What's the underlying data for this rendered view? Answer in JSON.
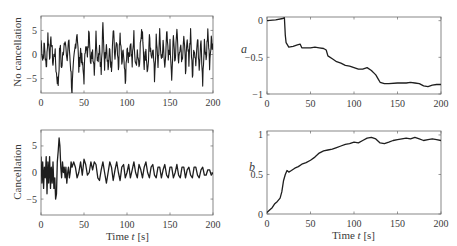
{
  "chart_data": [
    {
      "id": "no_cancellation",
      "type": "line",
      "ylabel": "No cancellation",
      "xlabel": "",
      "xlim": [
        0,
        200
      ],
      "ylim": [
        -8,
        8
      ],
      "xticks": [
        0,
        50,
        100,
        150,
        200
      ],
      "yticks": [
        -5,
        0,
        5
      ],
      "grid": false,
      "series": [
        {
          "name": "signal",
          "kind": "noise",
          "x": [
            0,
            2,
            4,
            6,
            8,
            10,
            12,
            14,
            16,
            18,
            20,
            22,
            24,
            26,
            28,
            30,
            32,
            34,
            36,
            38,
            40,
            42,
            44,
            46,
            48,
            50,
            52,
            54,
            56,
            58,
            60,
            62,
            64,
            66,
            68,
            70,
            72,
            74,
            76,
            78,
            80,
            82,
            84,
            86,
            88,
            90,
            92,
            94,
            96,
            98,
            100,
            102,
            104,
            106,
            108,
            110,
            112,
            114,
            116,
            118,
            120,
            122,
            124,
            126,
            128,
            130,
            132,
            134,
            136,
            138,
            140,
            142,
            144,
            146,
            148,
            150,
            152,
            154,
            156,
            158,
            160,
            162,
            164,
            166,
            168,
            170,
            172,
            174,
            176,
            178,
            180,
            182,
            184,
            186,
            188,
            190,
            192,
            194,
            196,
            198,
            200
          ],
          "y": [
            3,
            -1,
            2,
            -3,
            4,
            0,
            3,
            -2,
            1,
            -4,
            -6,
            2,
            -3,
            1,
            4,
            -2,
            3,
            -1,
            -7.5,
            -2,
            2,
            5,
            -3,
            1,
            -2,
            -5,
            3,
            -1,
            5.5,
            -2,
            1,
            -3,
            4,
            -1,
            2,
            -4,
            6,
            -2,
            3,
            -3,
            1,
            -4,
            5,
            -1,
            2,
            -3,
            4,
            -2,
            1,
            -6.5,
            2,
            -1,
            3,
            -2,
            4,
            -3,
            1,
            -2,
            3,
            5,
            -2,
            1,
            -4,
            3,
            -1,
            2,
            -5,
            3,
            -2,
            4,
            -1,
            2,
            -3,
            5,
            -1,
            2,
            -4,
            3,
            -1,
            6,
            -2,
            3,
            -1,
            4,
            -3,
            2,
            -1,
            5,
            -5,
            2,
            -1,
            3,
            -2,
            4,
            -6,
            2,
            -1,
            5,
            -2,
            3,
            1
          ]
        }
      ]
    },
    {
      "id": "a_param",
      "type": "line",
      "ylabel": "a",
      "xlabel": "",
      "xlim": [
        0,
        200
      ],
      "ylim": [
        -1,
        0.05
      ],
      "xticks": [
        0,
        50,
        100,
        150,
        200
      ],
      "yticks": [
        -1,
        -0.5,
        0
      ],
      "ytick_labels": [
        "−1",
        "−0.5",
        "0"
      ],
      "grid": false,
      "series": [
        {
          "name": "a",
          "x": [
            0,
            10,
            18,
            20,
            21,
            22,
            25,
            30,
            35,
            38,
            40,
            45,
            50,
            55,
            60,
            65,
            68,
            70,
            75,
            80,
            85,
            90,
            95,
            100,
            105,
            110,
            115,
            120,
            125,
            128,
            130,
            135,
            140,
            150,
            160,
            165,
            170,
            175,
            180,
            185,
            190,
            195,
            200
          ],
          "y": [
            0,
            0.01,
            0.03,
            0.04,
            -0.2,
            -0.3,
            -0.36,
            -0.35,
            -0.33,
            -0.32,
            -0.37,
            -0.37,
            -0.37,
            -0.36,
            -0.37,
            -0.38,
            -0.4,
            -0.48,
            -0.52,
            -0.56,
            -0.58,
            -0.61,
            -0.62,
            -0.64,
            -0.66,
            -0.66,
            -0.64,
            -0.68,
            -0.74,
            -0.8,
            -0.84,
            -0.86,
            -0.86,
            -0.85,
            -0.85,
            -0.84,
            -0.85,
            -0.86,
            -0.89,
            -0.9,
            -0.88,
            -0.87,
            -0.87
          ]
        }
      ]
    },
    {
      "id": "cancellation",
      "type": "line",
      "ylabel": "Cancellation",
      "xlabel": "Time t [s]",
      "xlim": [
        0,
        200
      ],
      "ylim": [
        -8,
        8
      ],
      "xticks": [
        0,
        50,
        100,
        150,
        200
      ],
      "yticks": [
        -5,
        0,
        5
      ],
      "grid": false,
      "series": [
        {
          "name": "signal",
          "x": [
            0,
            1,
            2,
            3,
            4,
            5,
            6,
            7,
            8,
            9,
            10,
            11,
            12,
            13,
            14,
            15,
            16,
            17,
            18,
            19,
            20,
            21,
            22,
            23,
            24,
            25,
            26,
            27,
            28,
            29,
            30,
            31,
            32,
            33,
            34,
            35,
            36,
            38,
            40,
            42,
            44,
            46,
            48,
            50,
            52,
            54,
            56,
            58,
            60,
            62,
            64,
            66,
            68,
            70,
            72,
            74,
            76,
            78,
            80,
            82,
            84,
            86,
            88,
            90,
            92,
            94,
            96,
            98,
            100,
            102,
            104,
            106,
            108,
            110,
            112,
            114,
            116,
            118,
            120,
            122,
            124,
            126,
            128,
            130,
            132,
            134,
            136,
            138,
            140,
            142,
            144,
            146,
            148,
            150,
            152,
            154,
            156,
            158,
            160,
            162,
            164,
            166,
            168,
            170,
            172,
            174,
            176,
            178,
            180,
            182,
            184,
            186,
            188,
            190,
            192,
            194,
            196,
            198,
            200
          ],
          "y": [
            3,
            -2,
            2,
            -3,
            1,
            -1,
            3,
            -4,
            2,
            -2,
            3,
            -3,
            1,
            -2,
            2,
            -3,
            -1,
            -5,
            -4,
            2,
            4,
            6.5,
            5,
            1,
            -1,
            2,
            0,
            1,
            -1,
            1,
            -2,
            0,
            1,
            -1,
            0,
            2,
            1,
            2,
            1,
            -1,
            0,
            2,
            -0.5,
            2.5,
            1.5,
            -0.5,
            0,
            2,
            0.5,
            2,
            1.5,
            -1,
            -1.5,
            0.5,
            2,
            0,
            -2,
            0,
            2,
            1,
            -1.5,
            0.5,
            2,
            0,
            -1.5,
            1,
            1.5,
            -1,
            0,
            1.5,
            -1,
            0.5,
            2,
            0,
            -1,
            1.5,
            0.5,
            -1,
            1,
            2,
            0,
            -1,
            1,
            1.5,
            -0.5,
            -1,
            1,
            1,
            -1,
            0.5,
            1.5,
            -0.5,
            -1,
            1,
            1,
            -1,
            0,
            1.5,
            -0.5,
            -1,
            1,
            1,
            -1,
            0.5,
            1,
            -0.5,
            -1,
            1,
            1,
            -0.5,
            -1,
            0.5,
            1,
            -0.5,
            -0.5,
            0.5,
            0.5,
            -0.5,
            0
          ]
        }
      ]
    },
    {
      "id": "b_param",
      "type": "line",
      "ylabel": "b",
      "xlabel": "Time t [s]",
      "xlim": [
        0,
        200
      ],
      "ylim": [
        0,
        1.05
      ],
      "xticks": [
        0,
        50,
        100,
        150,
        200
      ],
      "yticks": [
        0,
        0.5,
        1
      ],
      "ytick_labels": [
        "0",
        "0.5",
        "1"
      ],
      "grid": false,
      "series": [
        {
          "name": "b",
          "x": [
            0,
            3,
            6,
            9,
            12,
            15,
            17,
            19,
            21,
            23,
            25,
            28,
            32,
            36,
            40,
            45,
            50,
            55,
            60,
            65,
            70,
            75,
            80,
            85,
            90,
            95,
            100,
            105,
            110,
            115,
            120,
            125,
            130,
            135,
            140,
            145,
            150,
            155,
            160,
            165,
            170,
            175,
            180,
            185,
            190,
            195,
            200
          ],
          "y": [
            0.02,
            0.05,
            0.08,
            0.13,
            0.16,
            0.2,
            0.28,
            0.42,
            0.5,
            0.55,
            0.53,
            0.55,
            0.58,
            0.6,
            0.63,
            0.65,
            0.68,
            0.72,
            0.77,
            0.8,
            0.81,
            0.82,
            0.84,
            0.86,
            0.88,
            0.89,
            0.91,
            0.9,
            0.93,
            0.96,
            0.97,
            0.95,
            0.9,
            0.89,
            0.91,
            0.93,
            0.94,
            0.95,
            0.96,
            0.95,
            0.97,
            0.95,
            0.93,
            0.94,
            0.95,
            0.94,
            0.93
          ]
        }
      ]
    }
  ],
  "labels": {
    "no_cancellation": "No cancellation",
    "cancellation": "Cancellation",
    "a": "a",
    "b": "b",
    "time_prefix": "Time ",
    "time_var": "t",
    "time_unit": " [s]"
  }
}
